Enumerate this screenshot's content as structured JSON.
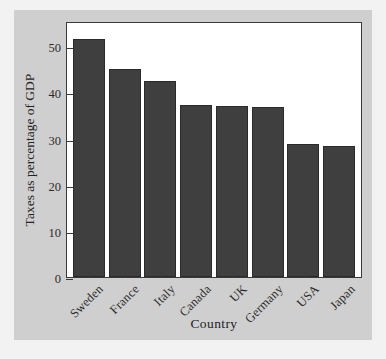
{
  "chart_data": {
    "type": "bar",
    "title": "",
    "xlabel": "Country",
    "ylabel": "Taxes as percentage of GDP",
    "categories": [
      "Sweden",
      "France",
      "Italy",
      "Canada",
      "UK",
      "Germany",
      "USA",
      "Japan"
    ],
    "values": [
      51.5,
      45.0,
      42.5,
      37.2,
      37.0,
      36.8,
      28.9,
      28.4
    ],
    "ylim": [
      0,
      55.5
    ],
    "yticks": [
      0,
      10,
      20,
      30,
      40,
      50
    ],
    "ytick_labels": [
      "0",
      "10",
      "20",
      "30",
      "40",
      "50"
    ],
    "grid": false,
    "legend": null,
    "bar_color": "#3f3f3f",
    "plot_background": "#ffffff",
    "figure_background": "#cfcfcf",
    "axis_color": "#3a3a3a"
  }
}
